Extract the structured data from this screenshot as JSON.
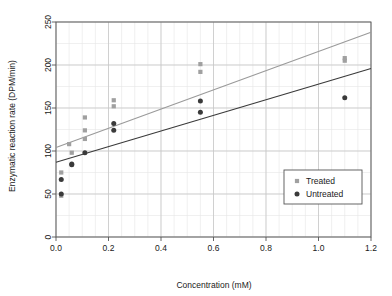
{
  "chart_data": {
    "type": "scatter",
    "title": "",
    "xlabel": "Concentration (mM)",
    "ylabel": "Enzymatic reaction rate (DPM/min)",
    "xlim": [
      0.0,
      1.2
    ],
    "ylim": [
      0,
      250
    ],
    "xticks": [
      0.0,
      0.2,
      0.4,
      0.6,
      0.8,
      1.0,
      1.2
    ],
    "xtick_labels": [
      "0.0",
      "0.2",
      "0.4",
      "0.6",
      "0.8",
      "1.0",
      "1.2"
    ],
    "yticks": [
      0,
      50,
      100,
      150,
      200,
      250
    ],
    "ytick_labels": [
      "0",
      "50",
      "100",
      "150",
      "200",
      "250"
    ],
    "grid": true,
    "minor_grid": true,
    "legend_position": "lower right",
    "series": [
      {
        "name": "Treated",
        "marker": "square",
        "color": "#a0a0a0",
        "points": [
          [
            0.02,
            75
          ],
          [
            0.02,
            48
          ],
          [
            0.05,
            108
          ],
          [
            0.06,
            98
          ],
          [
            0.11,
            139
          ],
          [
            0.11,
            124
          ],
          [
            0.11,
            114
          ],
          [
            0.22,
            159
          ],
          [
            0.22,
            152
          ],
          [
            0.55,
            201
          ],
          [
            0.55,
            192
          ],
          [
            1.1,
            208
          ],
          [
            1.1,
            205
          ]
        ],
        "fit_line": {
          "x": [
            0.0,
            1.2
          ],
          "y": [
            104,
            238
          ],
          "color": "#9a9a9a"
        }
      },
      {
        "name": "Untreated",
        "marker": "circle",
        "color": "#3a3a3a",
        "points": [
          [
            0.02,
            67
          ],
          [
            0.02,
            50
          ],
          [
            0.06,
            85
          ],
          [
            0.06,
            84
          ],
          [
            0.11,
            98
          ],
          [
            0.22,
            132
          ],
          [
            0.22,
            124
          ],
          [
            0.55,
            158
          ],
          [
            0.55,
            145
          ],
          [
            1.1,
            162
          ]
        ],
        "fit_line": {
          "x": [
            0.0,
            1.2
          ],
          "y": [
            87,
            196
          ],
          "color": "#3a3a3a"
        }
      }
    ]
  },
  "colors": {
    "treated": "#a0a0a0",
    "untreated": "#3a3a3a",
    "axis": "#555555",
    "grid_major": "#c8c8c8",
    "grid_minor": "#e6e6e6",
    "background": "#ffffff"
  }
}
